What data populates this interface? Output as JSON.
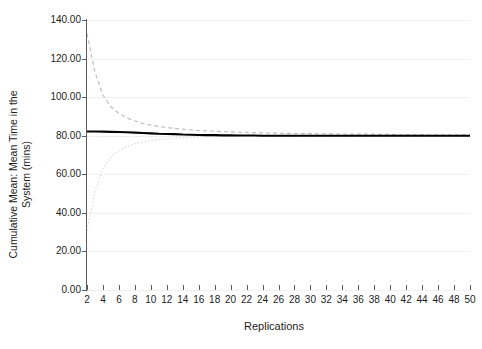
{
  "chart_data": {
    "type": "line",
    "title": "",
    "xlabel": "Replications",
    "ylabel": "Cumulative Mean: Mean Time in the System (mins)",
    "ylabel_line1": "Cumulative Mean: Mean Time in the",
    "ylabel_line2": "System (mins)",
    "xlim": [
      2,
      50
    ],
    "ylim": [
      0,
      140
    ],
    "grid": true,
    "legend": "none",
    "y_tick_labels": [
      "0.00",
      "20.00",
      "40.00",
      "60.00",
      "80.00",
      "100.00",
      "120.00",
      "140.00"
    ],
    "y_tick_values": [
      0,
      20,
      40,
      60,
      80,
      100,
      120,
      140
    ],
    "x_tick_labels": [
      "2",
      "4",
      "6",
      "8",
      "10",
      "12",
      "14",
      "16",
      "18",
      "20",
      "22",
      "24",
      "26",
      "28",
      "30",
      "32",
      "34",
      "36",
      "38",
      "40",
      "42",
      "44",
      "46",
      "48",
      "50"
    ],
    "x_tick_values": [
      2,
      4,
      6,
      8,
      10,
      12,
      14,
      16,
      18,
      20,
      22,
      24,
      26,
      28,
      30,
      32,
      34,
      36,
      38,
      40,
      42,
      44,
      46,
      48,
      50
    ],
    "x": [
      2,
      3,
      4,
      5,
      6,
      7,
      8,
      9,
      10,
      11,
      12,
      13,
      14,
      15,
      16,
      17,
      18,
      19,
      20,
      21,
      22,
      23,
      24,
      25,
      26,
      27,
      28,
      29,
      30,
      31,
      32,
      33,
      34,
      35,
      36,
      37,
      38,
      39,
      40,
      41,
      42,
      43,
      44,
      45,
      46,
      47,
      48,
      49,
      50
    ],
    "series": [
      {
        "name": "Cumulative Mean",
        "style": "solid",
        "color": "#000000",
        "values": [
          82.2,
          82.2,
          82.1,
          82.0,
          81.9,
          81.8,
          81.6,
          81.4,
          81.2,
          81.0,
          80.9,
          80.8,
          80.6,
          80.5,
          80.4,
          80.3,
          80.3,
          80.2,
          80.2,
          80.1,
          80.1,
          80.1,
          80.0,
          80.0,
          80.0,
          80.0,
          80.0,
          80.0,
          80.0,
          80.0,
          80.0,
          80.0,
          80.0,
          80.0,
          80.0,
          80.0,
          80.0,
          80.0,
          80.0,
          80.0,
          80.0,
          80.0,
          80.0,
          80.0,
          80.0,
          80.0,
          80.0,
          80.0,
          80.0
        ]
      },
      {
        "name": "Upper Confidence Limit",
        "style": "dashed",
        "color": "#bdbdbd",
        "values": [
          133.0,
          113.0,
          101.0,
          95.0,
          91.5,
          89.2,
          87.6,
          86.4,
          85.5,
          84.8,
          84.2,
          83.8,
          83.4,
          83.0,
          82.7,
          82.5,
          82.3,
          82.1,
          82.0,
          81.8,
          81.7,
          81.6,
          81.5,
          81.4,
          81.3,
          81.2,
          81.2,
          81.1,
          81.1,
          81.0,
          81.0,
          80.9,
          80.9,
          80.8,
          80.8,
          80.8,
          80.7,
          80.7,
          80.7,
          80.6,
          80.6,
          80.6,
          80.6,
          80.5,
          80.5,
          80.5,
          80.5,
          80.5,
          80.4
        ]
      },
      {
        "name": "Lower Confidence Limit",
        "style": "dotted",
        "color": "#d7d7d7",
        "values": [
          31.0,
          51.0,
          63.0,
          69.0,
          72.3,
          74.4,
          75.8,
          76.8,
          77.5,
          78.0,
          78.4,
          78.7,
          78.9,
          79.1,
          79.3,
          79.4,
          79.5,
          79.6,
          79.6,
          79.7,
          79.7,
          79.8,
          79.8,
          79.8,
          79.8,
          79.8,
          79.8,
          79.8,
          79.8,
          79.8,
          79.8,
          79.8,
          79.8,
          79.8,
          79.8,
          79.8,
          79.8,
          79.8,
          79.8,
          79.8,
          79.8,
          79.8,
          79.8,
          79.8,
          79.8,
          79.8,
          79.8,
          79.8,
          79.8
        ]
      }
    ]
  }
}
